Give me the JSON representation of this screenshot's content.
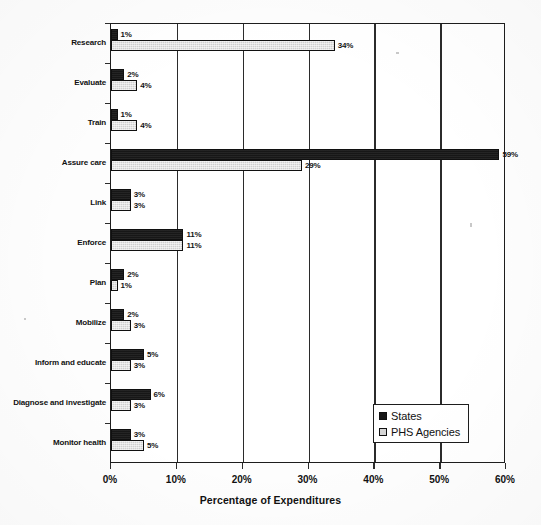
{
  "chart_data": {
    "type": "bar",
    "orientation": "horizontal",
    "title": "",
    "xlabel": "Percentage of Expenditures",
    "ylabel": "",
    "xlim": [
      0,
      60
    ],
    "xticks": [
      "0%",
      "10%",
      "20%",
      "30%",
      "40%",
      "50%",
      "60%"
    ],
    "xtick_values": [
      0,
      10,
      20,
      30,
      40,
      50,
      60
    ],
    "grid": true,
    "grid_axis": "x",
    "legend_position": "center-right-inside",
    "categories": [
      "Research",
      "Evaluate",
      "Train",
      "Assure care",
      "Link",
      "Enforce",
      "Plan",
      "Mobilize",
      "Inform and educate",
      "Diagnose and investigate",
      "Monitor health"
    ],
    "series": [
      {
        "name": "States",
        "color": "#171717",
        "values": [
          1,
          2,
          1,
          59,
          3,
          11,
          2,
          2,
          5,
          6,
          3
        ],
        "labels": [
          "1%",
          "2%",
          "1%",
          "59%",
          "3%",
          "11%",
          "2%",
          "2%",
          "5%",
          "6%",
          "3%"
        ]
      },
      {
        "name": "PHS Agencies",
        "color": "#cfcfcf",
        "values": [
          34,
          4,
          4,
          29,
          3,
          11,
          1,
          3,
          3,
          3,
          5
        ],
        "labels": [
          "34%",
          "4%",
          "4%",
          "29%",
          "3%",
          "11%",
          "1%",
          "3%",
          "3%",
          "3%",
          "5%"
        ]
      }
    ]
  },
  "legend": {
    "items": [
      {
        "label": "States",
        "swatch": "states"
      },
      {
        "label": "PHS Agencies",
        "swatch": "phs"
      }
    ]
  }
}
